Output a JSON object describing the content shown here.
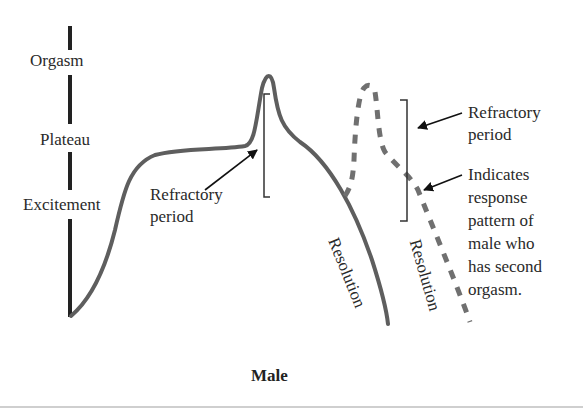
{
  "diagram": {
    "caption": "Male",
    "axis_labels": {
      "orgasm": "Orgasm",
      "plateau": "Plateau",
      "excitement": "Excitement"
    },
    "annotations": {
      "refractory_left_line1": "Refractory",
      "refractory_left_line2": "period",
      "refractory_right_line1": "Refractory",
      "refractory_right_line2": "period",
      "indicates_lines": [
        "Indicates",
        "response",
        "pattern of",
        "male who",
        "has second",
        "orgasm."
      ],
      "resolution_solid": "Resolution",
      "resolution_dashed": "Resolution"
    },
    "colors": {
      "solid_curve": "#5e5e5e",
      "dashed_curve": "#707070",
      "axis": "#222222",
      "text": "#2a2a2a"
    }
  }
}
